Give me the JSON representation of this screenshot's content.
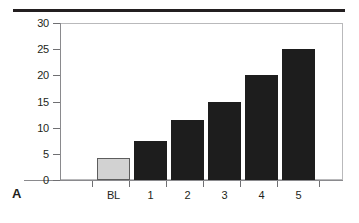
{
  "figure": {
    "panel_label": "A",
    "top_rule": "horizontal-rule"
  },
  "chart_data": {
    "type": "bar",
    "title": "",
    "xlabel": "",
    "ylabel": "",
    "categories": [
      "BL",
      "1",
      "2",
      "3",
      "4",
      "5"
    ],
    "values": [
      4.2,
      7.5,
      11.4,
      15.0,
      20.0,
      25.0
    ],
    "ylim": [
      0,
      30
    ],
    "ytick_labels": [
      "0",
      "5",
      "10",
      "15",
      "20",
      "25",
      "30"
    ],
    "ytick_values": [
      0,
      5,
      10,
      15,
      20,
      25,
      30
    ],
    "grid": false,
    "legend": null,
    "bar_colors": [
      "#d2d2d2",
      "#1d1d1d",
      "#1d1d1d",
      "#1d1d1d",
      "#1d1d1d",
      "#1d1d1d"
    ],
    "baseline_bar_index": 0,
    "baseline_bar_edge_color": "#5d5d5d",
    "series_color": "#1d1d1d"
  }
}
